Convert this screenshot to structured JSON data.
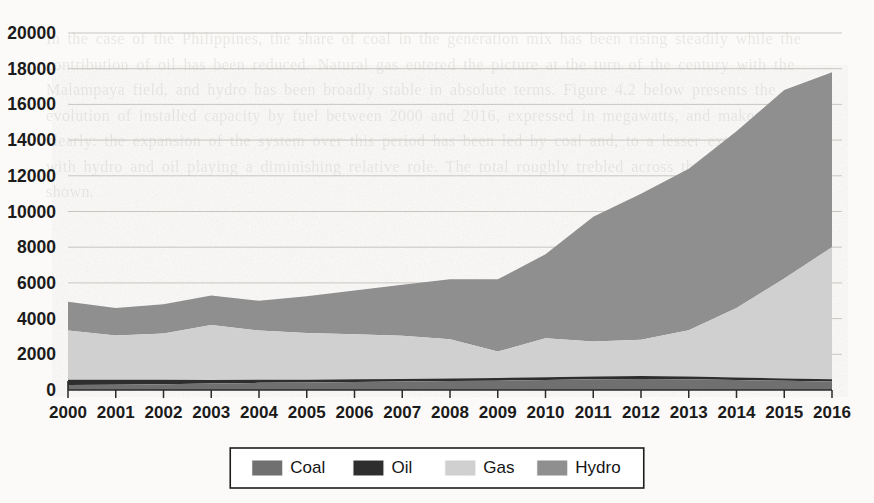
{
  "page": {
    "background_color": "#fbfaf8",
    "ghost_text": "In the case of the Philippines, the share of coal in the generation mix has been rising steadily while the contribution of oil has been reduced. Natural gas entered the picture at the turn of the century with the Malampaya field, and hydro has been broadly stable in absolute terms. Figure 4.2 below presents the evolution of installed capacity by fuel between 2000 and 2016, expressed in megawatts, and makes the point clearly: the expansion of the system over this period has been led by coal and, to a lesser extent, by gas, with hydro and oil playing a diminishing relative role. The total roughly trebled across the seventeen years shown."
  },
  "chart_data": {
    "type": "area",
    "stacked": true,
    "title": "",
    "xlabel": "",
    "ylabel": "",
    "xlim": [
      2000,
      2016
    ],
    "ylim": [
      0,
      20000
    ],
    "ytick_step": 2000,
    "grid": true,
    "legend_position": "bottom",
    "x": [
      2000,
      2001,
      2002,
      2003,
      2004,
      2005,
      2006,
      2007,
      2008,
      2009,
      2010,
      2011,
      2012,
      2013,
      2014,
      2015,
      2016
    ],
    "categories": [
      "2000",
      "2001",
      "2002",
      "2003",
      "2004",
      "2005",
      "2006",
      "2007",
      "2008",
      "2009",
      "2010",
      "2011",
      "2012",
      "2013",
      "2014",
      "2015",
      "2016"
    ],
    "ytick_labels": [
      "0",
      "2000",
      "4000",
      "6000",
      "8000",
      "10000",
      "12000",
      "14000",
      "16000",
      "18000",
      "20000"
    ],
    "ytick_values": [
      0,
      2000,
      4000,
      6000,
      8000,
      10000,
      12000,
      14000,
      16000,
      18000,
      20000
    ],
    "series": [
      {
        "name": "Coal",
        "color": "#707070",
        "values": [
          280,
          300,
          320,
          360,
          400,
          420,
          450,
          470,
          500,
          520,
          560,
          600,
          620,
          600,
          560,
          520,
          480
        ]
      },
      {
        "name": "Oil",
        "color": "#2e2e2e",
        "values": [
          290,
          270,
          250,
          200,
          170,
          160,
          150,
          150,
          150,
          150,
          160,
          160,
          160,
          150,
          140,
          130,
          120
        ]
      },
      {
        "name": "Gas",
        "color": "#d0d0d0",
        "values": [
          2760,
          2480,
          2600,
          3080,
          2760,
          2620,
          2520,
          2420,
          2200,
          1480,
          2180,
          1960,
          2040,
          2600,
          3900,
          5600,
          7400
        ]
      },
      {
        "name": "Hydro",
        "color": "#8f8f8f",
        "values": [
          1620,
          1550,
          1630,
          1660,
          1670,
          2050,
          2450,
          2860,
          3350,
          4050,
          4700,
          6980,
          8180,
          9050,
          9900,
          10550,
          9800
        ]
      }
    ],
    "totals": [
      4950,
      4600,
      4800,
      5300,
      5000,
      5250,
      5570,
      5900,
      6200,
      6200,
      7600,
      9700,
      11000,
      12400,
      14500,
      16800,
      17800
    ]
  },
  "legend": {
    "items": [
      {
        "label": "Coal",
        "color": "#707070"
      },
      {
        "label": "Oil",
        "color": "#2e2e2e"
      },
      {
        "label": "Gas",
        "color": "#d0d0d0"
      },
      {
        "label": "Hydro",
        "color": "#8f8f8f"
      }
    ]
  }
}
